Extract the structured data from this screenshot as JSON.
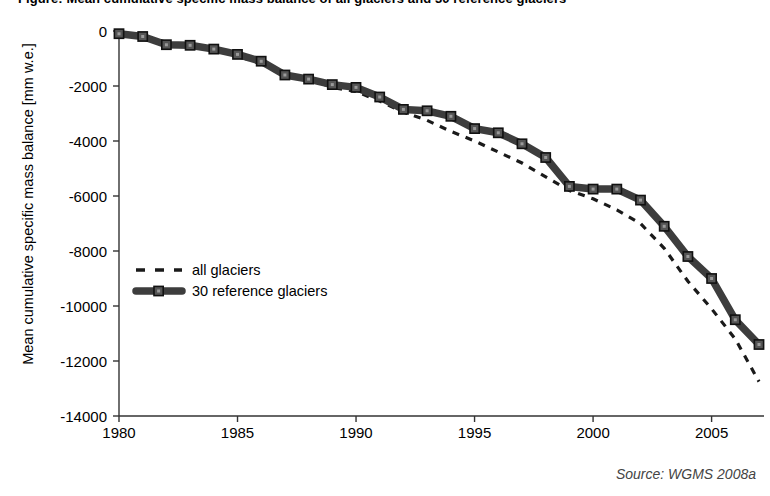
{
  "title": "Figure: Mean cumulative specific mass balance of all glaciers and 30 reference glaciers",
  "source_note": "Source: WGMS 2008a",
  "axes": {
    "ylabel": "Mean cumulative specific mass balance [mm w.e.]",
    "xlabel": "",
    "yticks": [
      "0",
      "-2000",
      "-4000",
      "-6000",
      "-8000",
      "-10000",
      "-12000",
      "-14000"
    ],
    "xticks": [
      "1980",
      "1985",
      "1990",
      "1995",
      "2000",
      "2005"
    ]
  },
  "legend": {
    "items": [
      {
        "label": "all glaciers",
        "style": "dashed",
        "color": "#1a1a1a"
      },
      {
        "label": "30 reference glaciers",
        "style": "solid-markers",
        "color": "#3a3a3a"
      }
    ]
  },
  "colors": {
    "all_glaciers": "#1a1a1a",
    "reference_glaciers": "#3d3d3d",
    "axis": "#333333",
    "text": "#000000"
  },
  "chart_data": {
    "type": "line",
    "title": "Mean cumulative specific mass balance of all glaciers and 30 reference glaciers",
    "xlabel": "",
    "ylabel": "Mean cumulative specific mass balance [mm w.e.]",
    "xlim": [
      1980,
      2007
    ],
    "ylim": [
      -14000,
      0
    ],
    "ytick_values": [
      0,
      -2000,
      -4000,
      -6000,
      -8000,
      -10000,
      -12000,
      -14000
    ],
    "xtick_values": [
      1980,
      1985,
      1990,
      1995,
      2000,
      2005
    ],
    "grid": false,
    "legend_position": "center-left",
    "x": [
      1980,
      1981,
      1982,
      1983,
      1984,
      1985,
      1986,
      1987,
      1988,
      1989,
      1990,
      1991,
      1992,
      1993,
      1994,
      1995,
      1996,
      1997,
      1998,
      1999,
      2000,
      2001,
      2002,
      2003,
      2004,
      2005,
      2006,
      2007
    ],
    "series": [
      {
        "name": "all glaciers",
        "style": "dashed",
        "values": [
          -100,
          -230,
          -530,
          -560,
          -700,
          -900,
          -1200,
          -1500,
          -1750,
          -2050,
          -2200,
          -2550,
          -2950,
          -3250,
          -3650,
          -4000,
          -4400,
          -4800,
          -5300,
          -5800,
          -6100,
          -6500,
          -7000,
          -7900,
          -9100,
          -10100,
          -11200,
          -12750
        ]
      },
      {
        "name": "30 reference glaciers",
        "style": "solid-markers",
        "values": [
          -100,
          -200,
          -500,
          -520,
          -660,
          -850,
          -1100,
          -1600,
          -1750,
          -1950,
          -2050,
          -2400,
          -2850,
          -2900,
          -3100,
          -3550,
          -3700,
          -4100,
          -4600,
          -5650,
          -5750,
          -5750,
          -6150,
          -7100,
          -8200,
          -9000,
          -10500,
          -11400
        ]
      }
    ]
  }
}
